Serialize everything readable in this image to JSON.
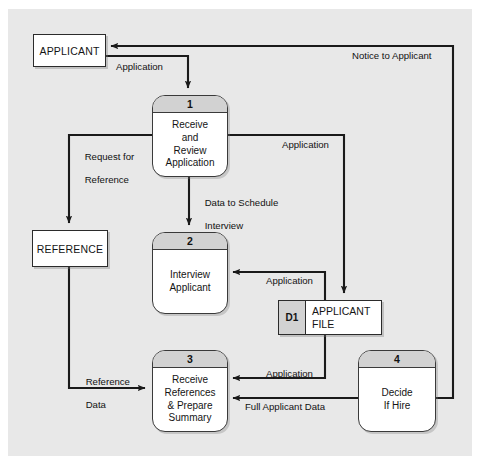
{
  "diagram": {
    "type": "data-flow-diagram",
    "background_color": "#e8e8e8",
    "page_color": "#ffffff",
    "line_color": "#1a1a1a",
    "header_fill": "#d2d2d2"
  },
  "entities": [
    {
      "id": "applicant",
      "label": "APPLICANT"
    },
    {
      "id": "reference",
      "label": "REFERENCE"
    }
  ],
  "processes": [
    {
      "id": "p1",
      "number": "1",
      "label": "Receive\nand\nReview\nApplication",
      "lines": [
        "Receive",
        "and",
        "Review",
        "Application"
      ]
    },
    {
      "id": "p2",
      "number": "2",
      "label": "Interview\nApplicant",
      "lines": [
        "Interview",
        "Applicant"
      ]
    },
    {
      "id": "p3",
      "number": "3",
      "label": "Receive\nReferences\n& Prepare\nSummary",
      "lines": [
        "Receive",
        "References",
        "& Prepare",
        "Summary"
      ]
    },
    {
      "id": "p4",
      "number": "4",
      "label": "Decide\nIf Hire",
      "lines": [
        "Decide",
        "If Hire"
      ]
    }
  ],
  "datastores": [
    {
      "id": "d1",
      "code": "D1",
      "name_line1": "APPLICANT",
      "name_line2": "FILE"
    }
  ],
  "flows": [
    {
      "id": "f-application-in",
      "label": "Application",
      "from": "applicant",
      "to": "p1"
    },
    {
      "id": "f-notice",
      "label": "Notice to Applicant",
      "from": "p4",
      "to": "applicant"
    },
    {
      "id": "f-request-reference",
      "label_line1": "Request for",
      "label_line2": "Reference",
      "label": "Request for Reference",
      "from": "p1",
      "to": "reference"
    },
    {
      "id": "f-schedule",
      "label_line1": "Data to Schedule",
      "label_line2": "Interview",
      "label": "Data to Schedule Interview",
      "from": "p1",
      "to": "p2"
    },
    {
      "id": "f-application-store",
      "label": "Application",
      "from": "p1",
      "to": "d1"
    },
    {
      "id": "f-application-p2",
      "label": "Application",
      "from": "d1",
      "to": "p2"
    },
    {
      "id": "f-application-p3",
      "label": "Application",
      "from": "d1",
      "to": "p3"
    },
    {
      "id": "f-reference-data",
      "label_line1": "Reference",
      "label_line2": "Data",
      "label": "Reference Data",
      "from": "reference",
      "to": "p3"
    },
    {
      "id": "f-full-applicant",
      "label": "Full Applicant Data",
      "from": "p4",
      "to": "p3"
    }
  ]
}
